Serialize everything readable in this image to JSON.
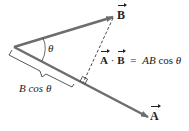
{
  "diagram": {
    "vector_a_label": "A",
    "vector_b_label": "B",
    "angle_label": "θ",
    "projection_label": "B cos θ",
    "formula": {
      "lhs_a": "A",
      "dot": "·",
      "lhs_b": "B",
      "equals": "=",
      "rhs_ab": "AB",
      "rhs_cos": "cos",
      "rhs_theta": "θ"
    },
    "colors": {
      "vector": "#6d6d6d",
      "dashed": "#333333",
      "text": "#222222"
    }
  }
}
